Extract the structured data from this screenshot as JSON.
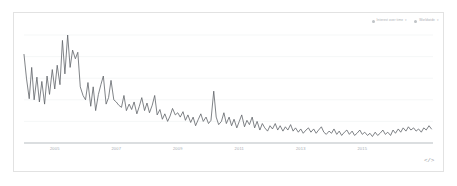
{
  "card": {
    "legend": [
      {
        "label": "Interest over time",
        "caret": "▾",
        "swatch": "#b5b9bd",
        "name": "legend-chip-interest-over-time"
      },
      {
        "label": "Worldwide",
        "caret": "▾",
        "swatch": "#b5b9bd",
        "name": "legend-chip-region"
      }
    ],
    "embed_icon": "</>"
  },
  "chart_data": {
    "type": "line",
    "title": "",
    "xlabel": "",
    "ylabel": "",
    "grid": true,
    "legend_position": "top-right",
    "series_color": "#5f6368",
    "axis_color": "#9aa0a6",
    "grid_color": "#f1f3f4",
    "xlim": [
      2004.0,
      2017.3
    ],
    "ylim": [
      0,
      100
    ],
    "gridlines_y": [
      0,
      20,
      40,
      60,
      80,
      100
    ],
    "tick_labels": [
      "2005",
      "2007",
      "2009",
      "2011",
      "2013",
      "2015"
    ],
    "tick_x": [
      2005.0,
      2007.0,
      2009.0,
      2011.0,
      2013.0,
      2015.0
    ],
    "x": [
      2004.0,
      2004.08,
      2004.17,
      2004.25,
      2004.33,
      2004.42,
      2004.5,
      2004.58,
      2004.67,
      2004.75,
      2004.83,
      2004.92,
      2005.0,
      2005.08,
      2005.17,
      2005.25,
      2005.33,
      2005.42,
      2005.5,
      2005.58,
      2005.67,
      2005.75,
      2005.83,
      2005.92,
      2006.0,
      2006.08,
      2006.17,
      2006.25,
      2006.33,
      2006.42,
      2006.5,
      2006.58,
      2006.67,
      2006.75,
      2006.83,
      2006.92,
      2007.0,
      2007.08,
      2007.17,
      2007.25,
      2007.33,
      2007.42,
      2007.5,
      2007.58,
      2007.67,
      2007.75,
      2007.83,
      2007.92,
      2008.0,
      2008.08,
      2008.17,
      2008.25,
      2008.33,
      2008.42,
      2008.5,
      2008.58,
      2008.67,
      2008.75,
      2008.83,
      2008.92,
      2009.0,
      2009.08,
      2009.17,
      2009.25,
      2009.33,
      2009.42,
      2009.5,
      2009.58,
      2009.67,
      2009.75,
      2009.83,
      2009.92,
      2010.0,
      2010.08,
      2010.17,
      2010.25,
      2010.33,
      2010.42,
      2010.5,
      2010.58,
      2010.67,
      2010.75,
      2010.83,
      2010.92,
      2011.0,
      2011.08,
      2011.17,
      2011.25,
      2011.33,
      2011.42,
      2011.5,
      2011.58,
      2011.67,
      2011.75,
      2011.83,
      2011.92,
      2012.0,
      2012.08,
      2012.17,
      2012.25,
      2012.33,
      2012.42,
      2012.5,
      2012.58,
      2012.67,
      2012.75,
      2012.83,
      2012.92,
      2013.0,
      2013.08,
      2013.17,
      2013.25,
      2013.33,
      2013.42,
      2013.5,
      2013.58,
      2013.67,
      2013.75,
      2013.83,
      2013.92,
      2014.0,
      2014.08,
      2014.17,
      2014.25,
      2014.33,
      2014.42,
      2014.5,
      2014.58,
      2014.67,
      2014.75,
      2014.83,
      2014.92,
      2015.0,
      2015.08,
      2015.17,
      2015.25,
      2015.33,
      2015.42,
      2015.5,
      2015.58,
      2015.67,
      2015.75,
      2015.83,
      2015.92,
      2016.0,
      2016.08,
      2016.17,
      2016.25,
      2016.33,
      2016.42,
      2016.5,
      2016.58,
      2016.67,
      2016.75,
      2016.83,
      2016.92,
      2017.0,
      2017.08,
      2017.17,
      2017.25
    ],
    "values": [
      82,
      60,
      41,
      70,
      40,
      61,
      38,
      57,
      36,
      62,
      45,
      68,
      50,
      72,
      54,
      95,
      64,
      100,
      70,
      86,
      78,
      84,
      52,
      44,
      40,
      56,
      34,
      52,
      30,
      45,
      54,
      62,
      36,
      42,
      58,
      40,
      38,
      35,
      33,
      44,
      30,
      36,
      31,
      38,
      27,
      34,
      42,
      30,
      37,
      28,
      35,
      44,
      26,
      31,
      22,
      27,
      20,
      25,
      32,
      26,
      28,
      24,
      29,
      21,
      26,
      19,
      24,
      16,
      22,
      27,
      20,
      24,
      18,
      21,
      48,
      24,
      17,
      20,
      28,
      18,
      24,
      16,
      22,
      14,
      20,
      26,
      15,
      21,
      17,
      24,
      14,
      20,
      12,
      18,
      14,
      11,
      16,
      13,
      18,
      12,
      16,
      11,
      15,
      12,
      17,
      11,
      14,
      10,
      13,
      9,
      12,
      14,
      10,
      13,
      9,
      12,
      15,
      10,
      8,
      11,
      9,
      13,
      8,
      11,
      7,
      10,
      12,
      8,
      11,
      7,
      9,
      12,
      8,
      10,
      7,
      9,
      6,
      10,
      7,
      9,
      12,
      8,
      10,
      7,
      12,
      9,
      13,
      10,
      14,
      11,
      15,
      12,
      14,
      11,
      13,
      10,
      14,
      12,
      16,
      13
    ]
  }
}
